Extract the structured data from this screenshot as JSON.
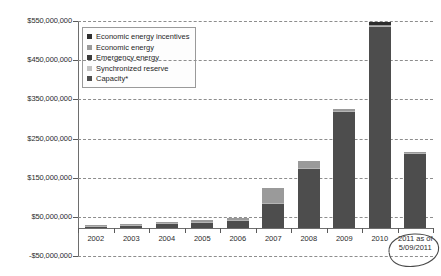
{
  "chart_data": {
    "type": "bar",
    "stacked": true,
    "title": "",
    "subtitle": "",
    "xlabel": "",
    "ylabel": "",
    "categories": [
      "2002",
      "2003",
      "2004",
      "2005",
      "2006",
      "2007",
      "2008",
      "2009",
      "2010",
      "2011 as of 5/09/2011"
    ],
    "ylim": [
      -50000000,
      550000000
    ],
    "ytick_values": [
      550000000,
      450000000,
      350000000,
      250000000,
      150000000,
      50000000,
      -50000000
    ],
    "ytick_labels": [
      "$550,000,000",
      "$450,000,000",
      "$350,000,000",
      "$250,000,000",
      "$150,000,000",
      "$50,000,000",
      "-$50,000,000"
    ],
    "grid": true,
    "grid_style": "dashed-horizontal",
    "legend_position": "upper-left-inside",
    "series": [
      {
        "name": "Capacity*",
        "color": "#4d4d4d",
        "values": [
          2000000,
          4000000,
          9000000,
          13000000,
          17000000,
          62000000,
          150000000,
          297000000,
          512000000,
          190000000
        ]
      },
      {
        "name": "Synchronized reserve",
        "color": "#b5b5b5",
        "values": [
          1000000,
          1000000,
          2000000,
          2000000,
          3000000,
          2000000,
          2000000,
          3000000,
          3000000,
          1000000
        ]
      },
      {
        "name": "Emergency energy",
        "color": "#3a3a3a",
        "values": [
          0,
          0,
          0,
          0,
          0,
          0,
          0,
          0,
          0,
          0
        ]
      },
      {
        "name": "Economic energy",
        "color": "#9a9a9a",
        "values": [
          1000000,
          1000000,
          3000000,
          5000000,
          6000000,
          37000000,
          18000000,
          4000000,
          4000000,
          2000000
        ]
      },
      {
        "name": "Economic energy incentives",
        "color": "#2e2e2e",
        "values": [
          0,
          0,
          0,
          0,
          0,
          0,
          0,
          0,
          8000000,
          0
        ]
      }
    ],
    "totals": [
      4000000,
      6000000,
      14000000,
      20000000,
      26000000,
      101000000,
      170000000,
      304000000,
      527000000,
      193000000
    ],
    "annotation": {
      "text": "2011 as of 5/09/2011",
      "shape": "hand-drawn-oval",
      "target": "2011 as of 5/09/2011"
    }
  },
  "legend": {
    "items": [
      {
        "label": "Economic energy incentives",
        "color": "#2e2e2e"
      },
      {
        "label": "Economic energy",
        "color": "#9a9a9a"
      },
      {
        "label": "Emergency energy",
        "color": "#3a3a3a"
      },
      {
        "label": "Synchronized reserve",
        "color": "#c2c2c2"
      },
      {
        "label": "Capacity*",
        "color": "#4d4d4d"
      }
    ]
  },
  "axis": {
    "y_labels": [
      "$550,000,000",
      "$450,000,000",
      "$350,000,000",
      "$250,000,000",
      "$150,000,000",
      "$50,000,000",
      "-$50,000,000"
    ],
    "x_labels": [
      "2002",
      "2003",
      "2004",
      "2005",
      "2006",
      "2007",
      "2008",
      "2009",
      "2010"
    ],
    "x_last_line1": "2011 as of",
    "x_last_line2": "5/09/2011"
  },
  "colors": {
    "grid": "#8d8d8d",
    "axis": "#6e6e6e",
    "background": "#ffffff",
    "annotation": "#4a4a4a"
  }
}
